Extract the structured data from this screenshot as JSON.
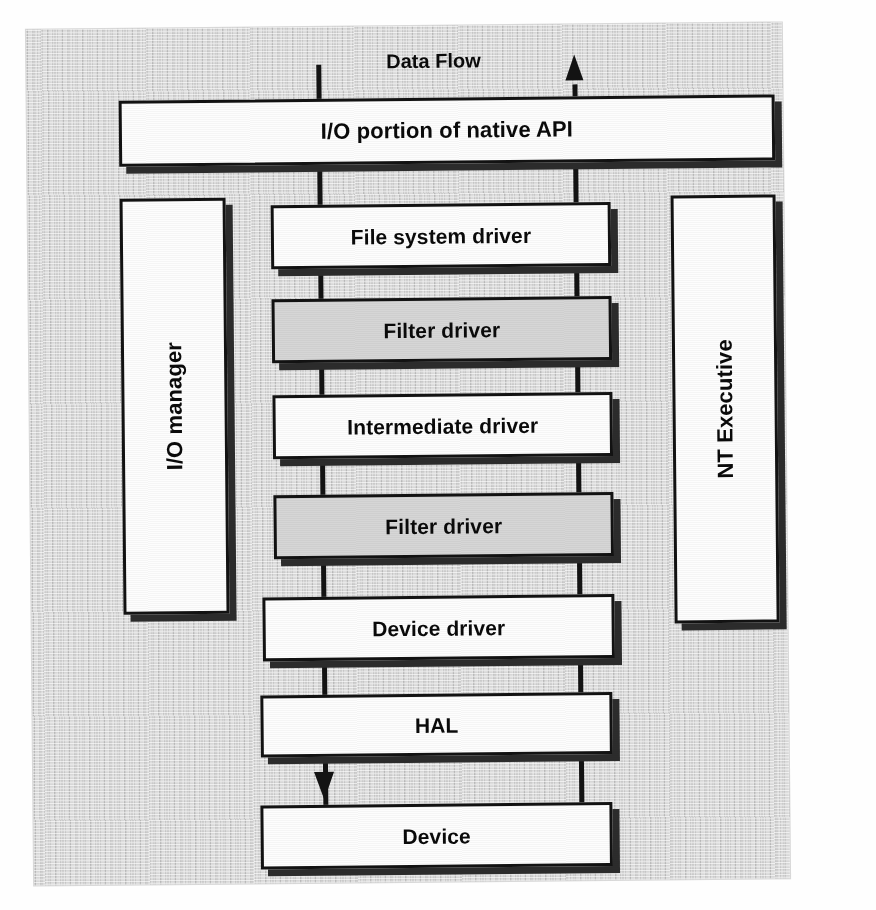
{
  "diagram": {
    "caption": "Data Flow",
    "flow_direction_up_label": "arrow-up",
    "flow_direction_down_label": "arrow-down",
    "colors": {
      "page_background": "#d2d2d2",
      "box_fill": "#fdfdfd",
      "highlight_box_fill": "#d6d6d6",
      "outline": "#121212",
      "shadow": "#2c2c2c"
    },
    "top_layer": {
      "label": "I/O portion of native API"
    },
    "left_column": {
      "label": "I/O manager",
      "orientation": "vertical"
    },
    "right_column": {
      "label": "NT Executive",
      "orientation": "vertical"
    },
    "stack": [
      {
        "label": "File system driver",
        "fill": "white"
      },
      {
        "label": "Filter driver",
        "fill": "gray"
      },
      {
        "label": "Intermediate driver",
        "fill": "white"
      },
      {
        "label": "Filter driver",
        "fill": "gray"
      },
      {
        "label": "Device driver",
        "fill": "white"
      },
      {
        "label": "HAL",
        "fill": "white"
      },
      {
        "label": "Device",
        "fill": "white"
      }
    ]
  }
}
